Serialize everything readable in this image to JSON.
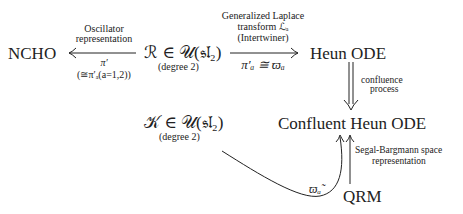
{
  "nodes": {
    "ncho": "NCHO",
    "r_elem": "ℛ ∈ 𝒰(𝔰𝔩₂)",
    "r_degree": "(degree 2)",
    "heun": "Heun ODE",
    "k_elem": "𝒦 ∈ 𝒰(𝔰𝔩₂)",
    "k_degree": "(degree 2)",
    "confluent": "Confluent Heun ODE",
    "qrm": "QRM"
  },
  "edges": {
    "r_to_ncho": {
      "label_top_1": "Oscillator",
      "label_top_2": "representation",
      "label_bottom_1": "π′",
      "label_bottom_2": "(≅π′ₐ(a=1,2))"
    },
    "r_to_heun": {
      "label_top_1": "Generalized Laplace",
      "label_top_2": "transform ℒₐ",
      "label_top_3": "(Intertwiner)",
      "label_bottom": "π′ₐ ≅ ϖₐ"
    },
    "heun_to_confluent": {
      "label_1": "confluence",
      "label_2": "process"
    },
    "qrm_to_confluent": {
      "label_1": "Segal-Bargmann space",
      "label_2": "representation"
    },
    "k_to_confluent": {
      "label": "ϖₐ̃"
    }
  }
}
